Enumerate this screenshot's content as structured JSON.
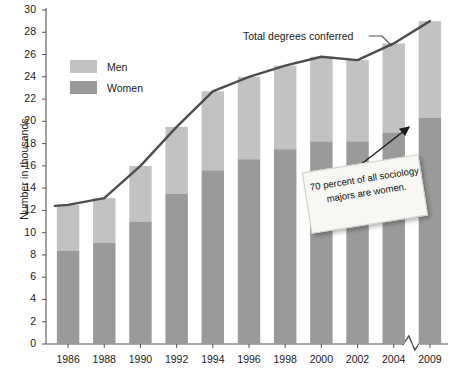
{
  "chart_data": {
    "type": "bar",
    "title": "",
    "subtitle": "",
    "xlabel": "",
    "ylabel": "Number in thousands",
    "ylim": [
      0,
      30
    ],
    "ytick_step": 2,
    "grid": false,
    "stacked": true,
    "legend_position": "inside-top-left",
    "categories": [
      "1986",
      "1988",
      "1990",
      "1992",
      "1994",
      "1996",
      "1998",
      "2000",
      "2002",
      "2004",
      "2009"
    ],
    "yticks": [
      "0",
      "2",
      "4",
      "6",
      "8",
      "10",
      "12",
      "14",
      "16",
      "18",
      "20",
      "22",
      "24",
      "26",
      "28",
      "30"
    ],
    "series": [
      {
        "name": "Women",
        "color": "#9a9a9a",
        "values": [
          8.4,
          9.1,
          11.0,
          13.5,
          15.6,
          16.6,
          17.5,
          18.2,
          18.2,
          19.0,
          20.3
        ]
      },
      {
        "name": "Men",
        "color": "#c2c2c2",
        "values": [
          4.1,
          4.0,
          5.0,
          6.0,
          7.1,
          7.4,
          7.5,
          7.6,
          7.3,
          8.0,
          8.7
        ]
      }
    ],
    "line_series": {
      "name": "Total degrees conferred",
      "color": "#4d4d4d",
      "values": [
        12.5,
        13.1,
        16.0,
        19.5,
        22.7,
        24.0,
        25.0,
        25.8,
        25.5,
        27.0,
        29.0
      ]
    },
    "annotations": [
      {
        "id": "line-label",
        "text": "Total degrees conferred"
      },
      {
        "id": "callout-note",
        "text": "70 percent of all sociology majors are women."
      }
    ],
    "axis_break": {
      "between": [
        "2004",
        "2009"
      ],
      "style": "zigzag"
    }
  },
  "legend": {
    "items": [
      {
        "label": "Men",
        "color": "#c2c2c2"
      },
      {
        "label": "Women",
        "color": "#9a9a9a"
      }
    ]
  },
  "colors": {
    "men": "#c2c2c2",
    "women": "#9a9a9a",
    "line": "#4d4d4d",
    "axis": "#555555",
    "text": "#1a1a1a",
    "note_bg": "#f7f7f4"
  }
}
